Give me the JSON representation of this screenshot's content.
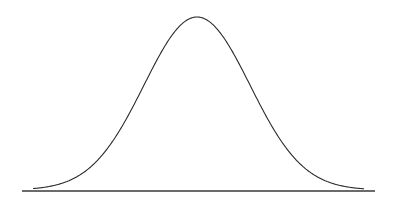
{
  "chart_data": {
    "type": "line",
    "title": "",
    "subtitle": "",
    "xlabel": "",
    "ylabel": "",
    "distribution": {
      "mean": 0,
      "std": 1
    },
    "x": [
      -3,
      -2.5,
      -2,
      -1.5,
      -1,
      -0.5,
      0,
      0.5,
      1,
      1.5,
      2,
      2.5,
      3
    ],
    "series": [
      {
        "name": "density",
        "values": [
          0.0044,
          0.0175,
          0.054,
          0.1295,
          0.242,
          0.3521,
          0.3989,
          0.3521,
          0.242,
          0.1295,
          0.054,
          0.0175,
          0.0044
        ]
      }
    ],
    "xlim": [
      -3.2,
      3.4
    ],
    "ylim": [
      0,
      0.4
    ],
    "grid": false,
    "legend": null
  },
  "style": {
    "line_color": "#2a2a2a",
    "axis_color": "#3a3a3a",
    "background": "#ffffff"
  }
}
